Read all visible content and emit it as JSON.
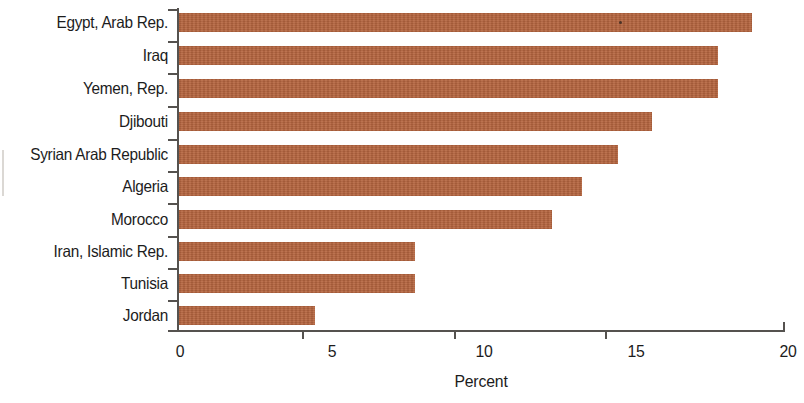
{
  "chart_data": {
    "type": "bar",
    "orientation": "horizontal",
    "title": "",
    "subtitle": "",
    "xlabel": "Percent",
    "ylabel": "",
    "xlim": [
      0,
      20
    ],
    "xticks": [
      0,
      5,
      10,
      15,
      20
    ],
    "xtick_labels": [
      "0",
      "5",
      "10",
      "15",
      "20"
    ],
    "grid": false,
    "legend": "none",
    "bar_color": "#b5653f",
    "axis_color": "#55524f",
    "text_color": "#1c1c1c",
    "categories": [
      "Egypt, Arab Rep.",
      "Iraq",
      "Yemen, Rep.",
      "Djibouti",
      "Syrian Arab Republic",
      "Algeria",
      "Morocco",
      "Iran, Islamic Rep.",
      "Tunisia",
      "Jordan"
    ],
    "values": [
      18.9,
      17.8,
      17.8,
      15.6,
      14.5,
      13.3,
      12.3,
      7.8,
      7.8,
      4.5
    ],
    "series": [
      {
        "name": "Percent",
        "values": [
          18.9,
          17.8,
          17.8,
          15.6,
          14.5,
          13.3,
          12.3,
          7.8,
          7.8,
          4.5
        ]
      }
    ]
  },
  "axis": {
    "x_title": "Percent",
    "tick_labels": [
      "0",
      "5",
      "10",
      "15",
      "20"
    ]
  }
}
